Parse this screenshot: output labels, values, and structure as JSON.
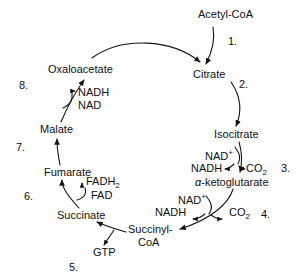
{
  "diagram": {
    "metabolites": {
      "acetyl_coa": "Acetyl-CoA",
      "citrate": "Citrate",
      "isocitrate": "Isocitrate",
      "alpha_ketoglutarate_prefix": "α",
      "alpha_ketoglutarate_rest": "-ketoglutarate",
      "succinyl_coa_line1": "Succinyl-",
      "succinyl_coa_line2": "CoA",
      "succinate": "Succinate",
      "fumarate": "Fumarate",
      "malate": "Malate",
      "oxaloacetate": "Oxaloacetate"
    },
    "cofactors": {
      "nad_plus_step3_base": "NAD",
      "nad_plus_step3_sup": "+",
      "nadh_step3": "NADH",
      "co2_step3_base": "CO",
      "co2_step3_sub": "2",
      "nad_plus_step4_base": "NAD",
      "nad_plus_step4_sup": "+",
      "nadh_step4": "NADH",
      "co2_step4_base": "CO",
      "co2_step4_sub": "2",
      "gtp": "GTP",
      "fadh2_base": "FADH",
      "fadh2_sub": "2",
      "fad": "FAD",
      "nadh_step8": "NADH",
      "nad_step8": "NAD"
    },
    "step_numbers": {
      "step1": "1.",
      "step2": "2.",
      "step3": "3.",
      "step4": "4.",
      "step5": "5.",
      "step6": "6.",
      "step7": "7.",
      "step8": "8."
    },
    "colors": {
      "stroke": "#141414",
      "text": "#101010",
      "background": "#ffffff"
    }
  }
}
